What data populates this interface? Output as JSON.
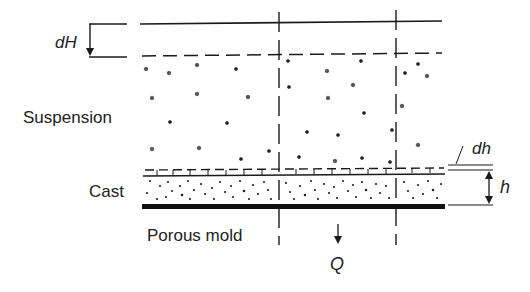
{
  "diagram": {
    "labels": {
      "dH": "dH",
      "suspension": "Suspension",
      "cast": "Cast",
      "porous_mold": "Porous mold",
      "dh": "dh",
      "h": "h",
      "Q": "Q"
    },
    "colors": {
      "ink": "#1a1a1a",
      "background": "#ffffff"
    }
  }
}
